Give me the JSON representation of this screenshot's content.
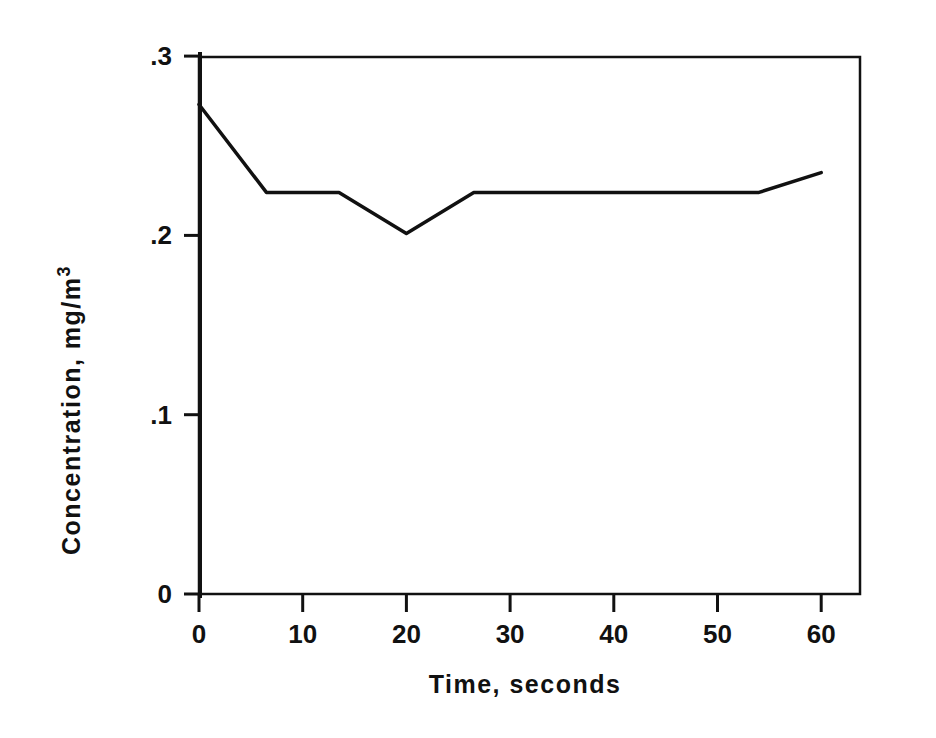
{
  "chart_data": {
    "type": "line",
    "title": "",
    "xlabel": "Time, seconds",
    "ylabel": "Concentration, mg/m",
    "ylabel_superscript": "3",
    "xlim": [
      0,
      65
    ],
    "ylim": [
      0,
      0.3
    ],
    "grid": false,
    "legend": null,
    "x_ticks": [
      0,
      10,
      20,
      30,
      40,
      50,
      60
    ],
    "x_tick_labels": [
      "0",
      "10",
      "20",
      "30",
      "40",
      "50",
      "60"
    ],
    "y_ticks": [
      0,
      0.1,
      0.2,
      0.3
    ],
    "y_tick_labels": [
      "0",
      ".1",
      ".2",
      ".3"
    ],
    "series": [
      {
        "name": "Concentration",
        "x": [
          0,
          6.5,
          13.5,
          20,
          26.5,
          54,
          60
        ],
        "y": [
          0.273,
          0.224,
          0.224,
          0.201,
          0.224,
          0.224,
          0.235
        ]
      }
    ]
  },
  "colors": {
    "line": "#111111",
    "frame": "#111111",
    "background": "#ffffff"
  }
}
